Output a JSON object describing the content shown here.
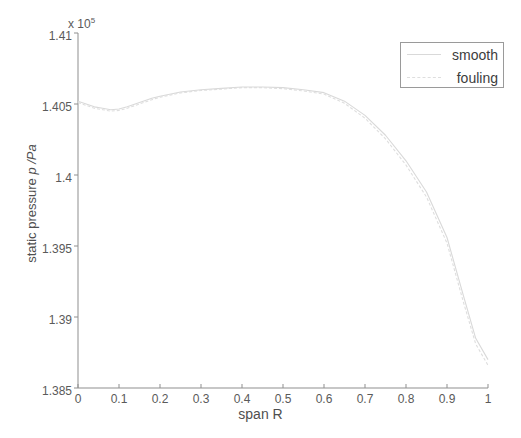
{
  "figure": {
    "background_color": "#ffffff",
    "axis_color": "#8f8f8f",
    "exponent_prefix": "x 10",
    "exponent_power": "5"
  },
  "axes": {
    "y_label_static": "static pressure ",
    "y_label_italic": "p /Pa",
    "x_label": "span R",
    "y_ticks": [
      "1.385",
      "1.39",
      "1.395",
      "1.4",
      "1.405",
      "1.41"
    ],
    "x_ticks": [
      "0",
      "0.1",
      "0.2",
      "0.3",
      "0.4",
      "0.5",
      "0.6",
      "0.7",
      "0.8",
      "0.9",
      "1"
    ]
  },
  "legend": {
    "position": "top-right",
    "entries": [
      {
        "label": "smooth",
        "color": "#d9d9d9"
      },
      {
        "label": "fouling",
        "color": "#dedede"
      }
    ]
  },
  "chart_data": {
    "type": "line",
    "title": "",
    "xlabel": "span R",
    "ylabel": "static pressure p /Pa",
    "xlim": [
      0,
      1
    ],
    "ylim": [
      138500,
      141000
    ],
    "y_exponent": 100000,
    "y_tick_values": [
      138500,
      139000,
      139500,
      140000,
      140500,
      141000
    ],
    "x_tick_values": [
      0,
      0.1,
      0.2,
      0.3,
      0.4,
      0.5,
      0.6,
      0.7,
      0.8,
      0.9,
      1.0
    ],
    "grid": false,
    "legend_position": "upper right",
    "x": [
      0.0,
      0.02,
      0.04,
      0.06,
      0.08,
      0.1,
      0.12,
      0.15,
      0.18,
      0.2,
      0.25,
      0.3,
      0.35,
      0.4,
      0.45,
      0.5,
      0.55,
      0.6,
      0.65,
      0.7,
      0.75,
      0.8,
      0.85,
      0.9,
      0.94,
      0.97,
      1.0
    ],
    "series": [
      {
        "name": "smooth",
        "color": "#d9d9d9",
        "values": [
          140520,
          140500,
          140480,
          140470,
          140460,
          140465,
          140480,
          140510,
          140540,
          140555,
          140585,
          140600,
          140610,
          140620,
          140620,
          140615,
          140600,
          140580,
          140520,
          140420,
          140280,
          140100,
          139880,
          139560,
          139150,
          138850,
          138700
        ]
      },
      {
        "name": "fouling",
        "color": "#dedede",
        "values": [
          140510,
          140490,
          140470,
          140460,
          140450,
          140455,
          140470,
          140500,
          140530,
          140548,
          140578,
          140595,
          140605,
          140615,
          140615,
          140608,
          140592,
          140570,
          140505,
          140400,
          140255,
          140070,
          139845,
          139520,
          139105,
          138810,
          138660
        ]
      }
    ]
  }
}
